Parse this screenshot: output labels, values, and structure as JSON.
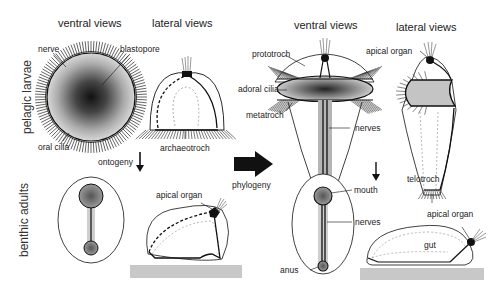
{
  "headers": {
    "left_ventral": "ventral views",
    "left_lateral": "lateral views",
    "right_ventral": "ventral views",
    "right_lateral": "lateral views"
  },
  "row_labels": {
    "top": "pelagic larvae",
    "bottom": "benthic adults"
  },
  "arrows": {
    "ontogeny": "ontogeny",
    "phylogeny": "phylogeny"
  },
  "labels": {
    "nerve": "nerve",
    "blastopore": "blastopore",
    "oral_cilia": "oral cilia",
    "archaeotroch": "archaeotroch",
    "apical_organ_left": "apical organ",
    "prototroch": "prototroch",
    "adoral_cilia": "adoral cilia",
    "metatroch": "metatroch",
    "nerves_larva": "nerves",
    "apical_organ_right_top": "apical organ",
    "telotroch": "telotroch",
    "mouth": "mouth",
    "nerves_adult": "nerves",
    "anus": "anus",
    "apical_organ_right_bottom": "apical organ",
    "gut": "gut"
  },
  "colors": {
    "line": "#111111",
    "substrate": "#c8c8c8",
    "stipple": "#8a8a8a"
  }
}
